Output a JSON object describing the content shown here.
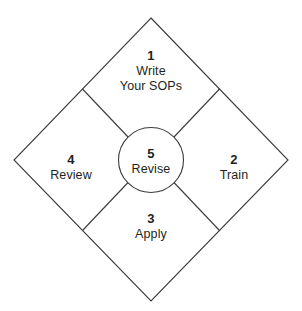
{
  "diagram": {
    "shape": "diamond",
    "background_color": "#ffffff",
    "stroke_color": "#3b3b3b",
    "text_color": "#231f20",
    "nodes": [
      {
        "id": "write",
        "position": "top",
        "number": "1",
        "label_line1": "Write",
        "label_line2": "Your SOPs"
      },
      {
        "id": "train",
        "position": "right",
        "number": "2",
        "label_line1": "Train",
        "label_line2": ""
      },
      {
        "id": "apply",
        "position": "bottom",
        "number": "3",
        "label_line1": "Apply",
        "label_line2": ""
      },
      {
        "id": "review",
        "position": "left",
        "number": "4",
        "label_line1": "Review",
        "label_line2": ""
      },
      {
        "id": "revise",
        "position": "center",
        "number": "5",
        "label_line1": "Revise",
        "label_line2": ""
      }
    ]
  }
}
